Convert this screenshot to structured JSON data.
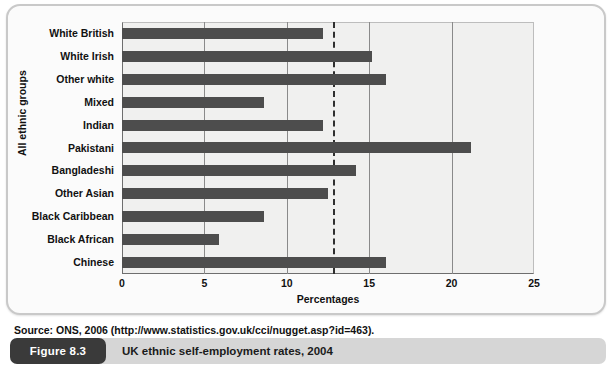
{
  "figure": {
    "number_label": "Figure 8.3",
    "caption": "UK ethnic self-employment rates, 2004",
    "source_note": "Source: ONS, 2006 (http://www.statistics.gov.uk/cci/nugget.asp?id=463)."
  },
  "colors": {
    "bar": "#4d4d4d",
    "plot_background": "#f0f0ef",
    "gridline": "#8a8a8a",
    "reference_line": "#2f2f2f",
    "caption_pill": "#3a3a3a",
    "caption_strip": "#d6d6d6",
    "card_border": "#c9c9c9"
  },
  "chart_data": {
    "type": "bar",
    "orientation": "horizontal",
    "title": "",
    "xlabel": "Percentages",
    "ylabel": "All ethnic groups",
    "xlim": [
      0,
      25
    ],
    "xticks": [
      0,
      5,
      10,
      15,
      20,
      25
    ],
    "xtick_labels": [
      "0",
      "5",
      "10",
      "15",
      "20",
      "25"
    ],
    "grid": "vertical gridlines at 5, 10, 15, 20",
    "legend": "none",
    "annotations": [
      {
        "type": "reference-line",
        "style": "dashed-vertical",
        "value": 12.8,
        "label": ""
      }
    ],
    "categories": [
      "White British",
      "White Irish",
      "Other white",
      "Mixed",
      "Indian",
      "Pakistani",
      "Bangladeshi",
      "Other Asian",
      "Black Caribbean",
      "Black African",
      "Chinese"
    ],
    "values": [
      12.2,
      15.2,
      16.0,
      8.6,
      12.2,
      21.2,
      14.2,
      12.5,
      8.6,
      5.9,
      16.0
    ]
  }
}
